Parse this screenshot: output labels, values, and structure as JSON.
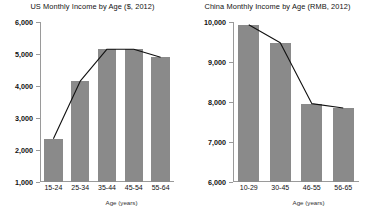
{
  "chart_data": [
    {
      "type": "bar",
      "id": "us-income",
      "title": "US Monthly Income by Age ($, 2012)",
      "xlabel": "Age (years)",
      "ylabel": "",
      "categories": [
        "15-24",
        "25-34",
        "35-44",
        "45-54",
        "55-64"
      ],
      "values": [
        2350,
        4150,
        5150,
        5150,
        4900
      ],
      "series": [
        {
          "name": "Monthly income",
          "type": "bar",
          "values": [
            2350,
            4150,
            5150,
            5150,
            4900
          ]
        },
        {
          "name": "Trend",
          "type": "line",
          "values": [
            2350,
            4150,
            5150,
            5150,
            4900
          ]
        }
      ],
      "ylim": [
        1000,
        6000
      ],
      "yticks": [
        1000,
        2000,
        3000,
        4000,
        5000,
        6000
      ],
      "ytick_labels": [
        "1,000",
        "2,000",
        "3,000",
        "4,000",
        "5,000",
        "6,000"
      ],
      "grid": false,
      "legend": "none",
      "bar_color": "#8a8a8a",
      "line_color": "#111111"
    },
    {
      "type": "bar",
      "id": "china-income",
      "title": "China Monthly Income by Age (RMB, 2012)",
      "xlabel": "Age (years)",
      "ylabel": "",
      "categories": [
        "10-29",
        "30-45",
        "46-55",
        "56-65"
      ],
      "values": [
        9930,
        9480,
        7960,
        7850
      ],
      "series": [
        {
          "name": "Monthly income",
          "type": "bar",
          "values": [
            9930,
            9480,
            7960,
            7850
          ]
        },
        {
          "name": "Trend",
          "type": "line",
          "values": [
            9930,
            9480,
            7960,
            7850
          ]
        }
      ],
      "ylim": [
        6000,
        10000
      ],
      "yticks": [
        6000,
        7000,
        8000,
        9000,
        10000
      ],
      "ytick_labels": [
        "6,000",
        "7,000",
        "8,000",
        "9,000",
        "10,000"
      ],
      "grid": false,
      "legend": "none",
      "bar_color": "#8a8a8a",
      "line_color": "#111111"
    }
  ]
}
